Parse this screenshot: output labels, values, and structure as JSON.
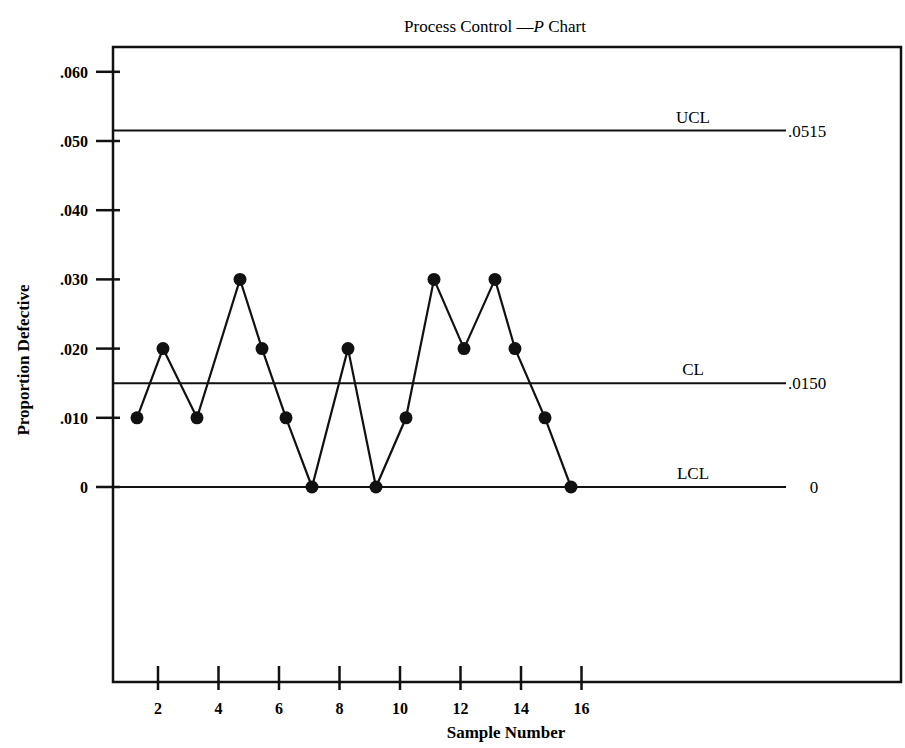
{
  "chart_data": {
    "type": "line",
    "title": "Process Control —P Chart",
    "title_parts": {
      "prefix": "Process Control —",
      "italic": "P",
      "suffix": " Chart"
    },
    "xlabel": "Sample Number",
    "ylabel": "Proportion Defective",
    "x_ticks": [
      2,
      4,
      6,
      8,
      10,
      12,
      14,
      16
    ],
    "x_tick_labels": [
      "2",
      "4",
      "6",
      "8",
      "10",
      "12",
      "14",
      "16"
    ],
    "y_ticks": [
      0,
      0.01,
      0.02,
      0.03,
      0.04,
      0.05,
      0.06
    ],
    "y_tick_labels": [
      "0",
      ".010",
      ".020",
      ".030",
      ".040",
      ".050",
      ".060"
    ],
    "xlim": [
      0.5,
      16.5
    ],
    "ylim": [
      0,
      0.06
    ],
    "grid": false,
    "legend": null,
    "x": [
      1,
      2,
      3,
      4,
      5,
      6,
      7,
      8,
      9,
      10,
      11,
      12,
      13,
      14,
      15,
      16
    ],
    "series": [
      {
        "name": "Proportion Defective",
        "values": [
          0.01,
          0.02,
          0.01,
          0.03,
          0.02,
          0.01,
          0.0,
          0.02,
          0.0,
          0.01,
          0.03,
          0.02,
          0.03,
          0.02,
          0.01,
          0.0
        ],
        "marker": "filled-circle",
        "color": "#111111"
      }
    ],
    "reference_lines": [
      {
        "label": "UCL",
        "value": 0.0515,
        "value_label": ".0515"
      },
      {
        "label": "CL",
        "value": 0.015,
        "value_label": ".0150"
      },
      {
        "label": "LCL",
        "value": 0,
        "value_label": "0"
      }
    ]
  }
}
